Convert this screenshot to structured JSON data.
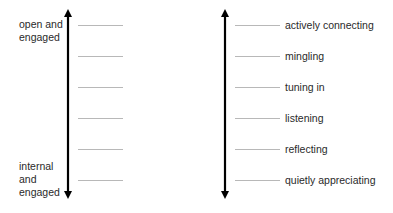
{
  "left_scale": {
    "top_label": "open and engaged",
    "top_label_lines": [
      "open and",
      "engaged"
    ],
    "bottom_label": "internal and engaged",
    "bottom_label_lines": [
      "internal",
      "and",
      "engaged"
    ],
    "tick_count": 6
  },
  "right_scale": {
    "levels": [
      {
        "label": "actively connecting"
      },
      {
        "label": "mingling"
      },
      {
        "label": "tuning in"
      },
      {
        "label": "listening"
      },
      {
        "label": "reflecting"
      },
      {
        "label": "quietly appreciating"
      }
    ]
  },
  "colors": {
    "arrow": "#000000",
    "tick": "#b8b8b8",
    "text": "#2a2a2a"
  }
}
